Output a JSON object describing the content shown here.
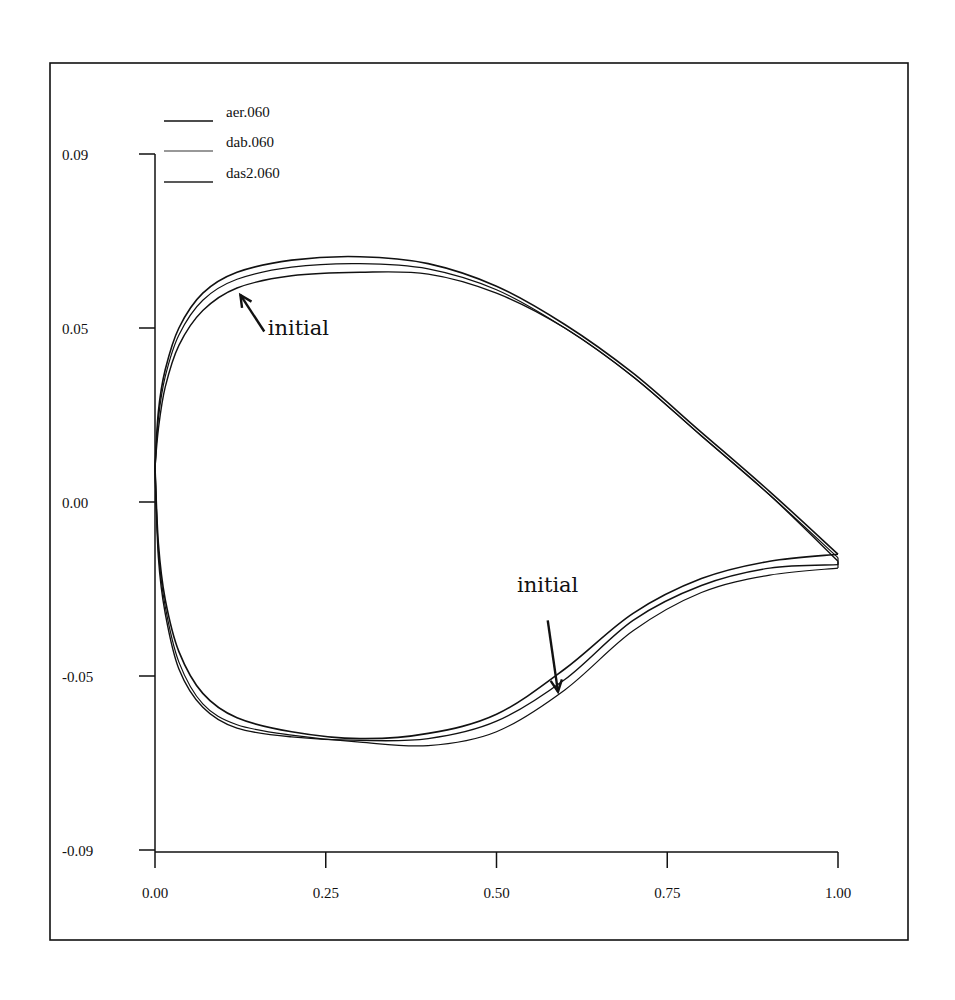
{
  "chart_data": {
    "type": "line",
    "title": "",
    "xlabel": "",
    "ylabel": "",
    "xlim": [
      0.0,
      1.0
    ],
    "ylim": [
      -0.09,
      0.09
    ],
    "grid": false,
    "legend_position": "upper-left",
    "x_ticks": [
      {
        "value": 0.0,
        "label": "0.00"
      },
      {
        "value": 0.25,
        "label": "0.25"
      },
      {
        "value": 0.5,
        "label": "0.50"
      },
      {
        "value": 0.75,
        "label": "0.75"
      },
      {
        "value": 1.0,
        "label": "1.00"
      }
    ],
    "y_ticks": [
      {
        "pos": 0.1,
        "label": "0.09"
      },
      {
        "pos": 0.05,
        "label": "0.05"
      },
      {
        "pos": 0.0,
        "label": "0.00"
      },
      {
        "pos": -0.05,
        "label": "-0.05"
      },
      {
        "pos": -0.1,
        "label": "-0.09"
      }
    ],
    "series": [
      {
        "name": "aer.060",
        "stroke_width": 1.6,
        "upper": {
          "x": [
            0,
            0.005,
            0.015,
            0.035,
            0.07,
            0.12,
            0.2,
            0.3,
            0.4,
            0.5,
            0.6,
            0.7,
            0.8,
            0.9,
            1.0
          ],
          "y": [
            0.01,
            0.026,
            0.038,
            0.05,
            0.06,
            0.066,
            0.0695,
            0.0705,
            0.0685,
            0.062,
            0.051,
            0.037,
            0.02,
            0.003,
            -0.015
          ]
        },
        "lower": {
          "x": [
            0,
            0.005,
            0.015,
            0.035,
            0.07,
            0.12,
            0.2,
            0.3,
            0.4,
            0.5,
            0.6,
            0.7,
            0.8,
            0.9,
            1.0
          ],
          "y": [
            0.01,
            -0.012,
            -0.028,
            -0.043,
            -0.055,
            -0.062,
            -0.066,
            -0.068,
            -0.0665,
            -0.061,
            -0.048,
            -0.032,
            -0.022,
            -0.017,
            -0.015
          ]
        }
      },
      {
        "name": "dab.060",
        "stroke_width": 1.2,
        "upper": {
          "x": [
            0,
            0.005,
            0.015,
            0.035,
            0.07,
            0.12,
            0.2,
            0.3,
            0.4,
            0.5,
            0.6,
            0.7,
            0.8,
            0.9,
            1.0
          ],
          "y": [
            0.01,
            0.024,
            0.036,
            0.048,
            0.058,
            0.064,
            0.0675,
            0.0685,
            0.067,
            0.061,
            0.05,
            0.036,
            0.019,
            0.002,
            -0.016
          ]
        },
        "lower": {
          "x": [
            0,
            0.005,
            0.015,
            0.035,
            0.07,
            0.12,
            0.2,
            0.3,
            0.4,
            0.5,
            0.6,
            0.7,
            0.8,
            0.9,
            1.0
          ],
          "y": [
            0.01,
            -0.014,
            -0.03,
            -0.046,
            -0.058,
            -0.064,
            -0.067,
            -0.069,
            -0.07,
            -0.066,
            -0.054,
            -0.037,
            -0.026,
            -0.021,
            -0.019
          ]
        }
      },
      {
        "name": "das2.060",
        "stroke_width": 1.4,
        "upper": {
          "x": [
            0,
            0.005,
            0.015,
            0.035,
            0.07,
            0.12,
            0.2,
            0.3,
            0.4,
            0.5,
            0.6,
            0.7,
            0.8,
            0.9,
            1.0
          ],
          "y": [
            0.01,
            0.021,
            0.033,
            0.045,
            0.055,
            0.0615,
            0.065,
            0.066,
            0.0655,
            0.06,
            0.05,
            0.036,
            0.019,
            0.002,
            -0.017
          ]
        },
        "lower": {
          "x": [
            0,
            0.005,
            0.015,
            0.035,
            0.07,
            0.12,
            0.2,
            0.3,
            0.4,
            0.5,
            0.6,
            0.7,
            0.8,
            0.9,
            1.0
          ],
          "y": [
            0.01,
            -0.016,
            -0.032,
            -0.048,
            -0.059,
            -0.065,
            -0.0675,
            -0.0685,
            -0.068,
            -0.063,
            -0.051,
            -0.034,
            -0.024,
            -0.019,
            -0.018
          ]
        }
      }
    ],
    "annotations": [
      {
        "text": "initial",
        "text_x": 0.165,
        "text_y": 0.048,
        "arrow_from": [
          0.16,
          0.049
        ],
        "arrow_to": [
          0.125,
          0.0595
        ]
      },
      {
        "text": "initial",
        "text_x": 0.53,
        "text_y": -0.026,
        "arrow_from": [
          0.575,
          -0.034
        ],
        "arrow_to": [
          0.59,
          -0.0545
        ]
      }
    ]
  },
  "legend": {
    "items": [
      {
        "label": "aer.060"
      },
      {
        "label": "dab.060"
      },
      {
        "label": "das2.060"
      }
    ]
  }
}
